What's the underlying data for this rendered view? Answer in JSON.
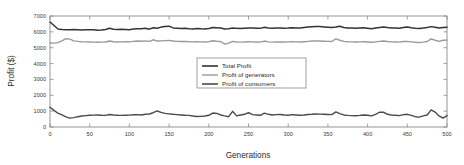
{
  "chart_data": {
    "type": "line",
    "title": "",
    "xlabel": "Generations",
    "ylabel": "Profit ($)",
    "xlim": [
      0,
      500
    ],
    "ylim": [
      0,
      7000
    ],
    "xticks": [
      0,
      50,
      100,
      150,
      200,
      250,
      300,
      350,
      400,
      450,
      500
    ],
    "yticks": [
      0,
      1000,
      2000,
      3000,
      4000,
      5000,
      6000,
      7000
    ],
    "xtick_labels": [
      "0",
      "50",
      "100",
      "150",
      "200",
      "250",
      "300",
      "350",
      "400",
      "450",
      "500"
    ],
    "ytick_labels": [
      "0",
      "1000",
      "2000",
      "3000",
      "4000",
      "5000",
      "6000",
      "7000"
    ],
    "grid": false,
    "legend_position": "center",
    "x": [
      0,
      5,
      10,
      15,
      20,
      25,
      30,
      35,
      40,
      45,
      50,
      55,
      60,
      65,
      70,
      75,
      80,
      85,
      90,
      95,
      100,
      105,
      110,
      115,
      120,
      125,
      130,
      135,
      140,
      145,
      150,
      155,
      160,
      165,
      170,
      175,
      180,
      185,
      190,
      195,
      200,
      205,
      210,
      215,
      220,
      225,
      230,
      235,
      240,
      245,
      250,
      255,
      260,
      265,
      270,
      275,
      280,
      285,
      290,
      295,
      300,
      305,
      310,
      315,
      320,
      325,
      330,
      335,
      340,
      345,
      350,
      355,
      360,
      365,
      370,
      375,
      380,
      385,
      390,
      395,
      400,
      405,
      410,
      415,
      420,
      425,
      430,
      435,
      440,
      445,
      450,
      455,
      460,
      465,
      470,
      475,
      480,
      485,
      490,
      495,
      500
    ],
    "series": [
      {
        "name": "Total Profit",
        "color": "#333333",
        "width": 1.5,
        "values": [
          6620,
          6400,
          6180,
          6150,
          6140,
          6130,
          6150,
          6140,
          6120,
          6130,
          6140,
          6130,
          6100,
          6120,
          6150,
          6230,
          6170,
          6150,
          6160,
          6150,
          6140,
          6180,
          6200,
          6190,
          6230,
          6170,
          6260,
          6230,
          6300,
          6340,
          6360,
          6250,
          6230,
          6210,
          6230,
          6200,
          6180,
          6210,
          6190,
          6180,
          6210,
          6280,
          6260,
          6240,
          6180,
          6200,
          6250,
          6220,
          6210,
          6230,
          6250,
          6240,
          6230,
          6220,
          6290,
          6250,
          6230,
          6240,
          6250,
          6230,
          6240,
          6260,
          6250,
          6240,
          6270,
          6300,
          6320,
          6340,
          6330,
          6310,
          6290,
          6270,
          6300,
          6350,
          6280,
          6250,
          6240,
          6230,
          6250,
          6260,
          6230,
          6200,
          6240,
          6280,
          6300,
          6270,
          6250,
          6240,
          6230,
          6280,
          6300,
          6260,
          6230,
          6210,
          6240,
          6280,
          6330,
          6290,
          6240,
          6280,
          6290
        ]
      },
      {
        "name": "Profit of generators",
        "color": "#9a9a9a",
        "width": 1.4,
        "values": [
          5300,
          5290,
          5320,
          5430,
          5570,
          5540,
          5430,
          5400,
          5380,
          5370,
          5360,
          5350,
          5340,
          5350,
          5360,
          5420,
          5380,
          5360,
          5370,
          5380,
          5370,
          5400,
          5420,
          5410,
          5430,
          5400,
          5500,
          5420,
          5430,
          5450,
          5460,
          5420,
          5400,
          5390,
          5400,
          5380,
          5370,
          5380,
          5370,
          5360,
          5380,
          5440,
          5410,
          5390,
          5230,
          5290,
          5400,
          5360,
          5350,
          5360,
          5380,
          5370,
          5360,
          5350,
          5420,
          5370,
          5350,
          5360,
          5370,
          5360,
          5370,
          5380,
          5370,
          5360,
          5380,
          5400,
          5420,
          5430,
          5420,
          5410,
          5400,
          5390,
          5560,
          5470,
          5400,
          5380,
          5370,
          5360,
          5370,
          5380,
          5360,
          5340,
          5370,
          5400,
          5420,
          5390,
          5370,
          5360,
          5350,
          5390,
          5400,
          5370,
          5340,
          5320,
          5350,
          5390,
          5560,
          5470,
          5400,
          5470,
          5480
        ]
      },
      {
        "name": "Profit of consumers",
        "color": "#4a4a4a",
        "width": 1.4,
        "values": [
          1250,
          1050,
          870,
          760,
          640,
          560,
          590,
          650,
          690,
          720,
          740,
          750,
          760,
          740,
          730,
          790,
          760,
          740,
          730,
          740,
          750,
          770,
          780,
          760,
          800,
          820,
          900,
          1010,
          920,
          860,
          830,
          800,
          780,
          760,
          740,
          730,
          690,
          660,
          670,
          690,
          740,
          880,
          860,
          760,
          700,
          650,
          990,
          700,
          760,
          800,
          900,
          780,
          760,
          740,
          870,
          800,
          760,
          780,
          790,
          760,
          740,
          780,
          760,
          740,
          760,
          790,
          800,
          820,
          810,
          800,
          790,
          780,
          950,
          840,
          760,
          730,
          720,
          710,
          730,
          760,
          740,
          700,
          800,
          930,
          940,
          800,
          760,
          740,
          720,
          780,
          800,
          730,
          650,
          620,
          700,
          760,
          1080,
          940,
          700,
          560,
          720
        ]
      }
    ]
  },
  "legend": {
    "items": [
      {
        "label": "Total Profit",
        "color": "#333333"
      },
      {
        "label": "Profit of generators",
        "color": "#9a9a9a"
      },
      {
        "label": "Profit of consumers",
        "color": "#4a4a4a"
      }
    ]
  }
}
